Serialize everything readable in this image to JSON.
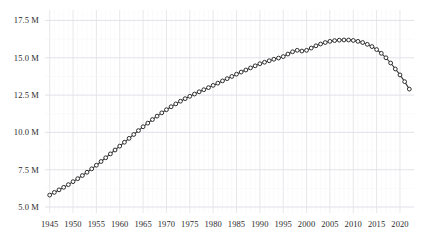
{
  "chart_data": {
    "type": "line",
    "title": "",
    "subtitle": "",
    "xlabel": "",
    "ylabel": "",
    "xlim": [
      1944,
      2023
    ],
    "ylim": [
      4600000,
      18200000
    ],
    "grid": true,
    "legend": false,
    "marker": "open-circle",
    "line_color": "#3a3a3a",
    "marker_face_color": "#ffffff",
    "marker_edge_color": "#2e2e2e",
    "grid_color": "#e8e8ec",
    "background_color": "#ffffff",
    "ytick_values": [
      5000000,
      7500000,
      10000000,
      12500000,
      15000000,
      17500000
    ],
    "ytick_labels": [
      "5.0 M",
      "7.5 M",
      "10.0 M",
      "12.5 M",
      "15.0 M",
      "17.5 M"
    ],
    "xtick_values": [
      1945,
      1950,
      1955,
      1960,
      1965,
      1970,
      1975,
      1980,
      1985,
      1990,
      1995,
      2000,
      2005,
      2010,
      2015,
      2020
    ],
    "xtick_labels": [
      "1945",
      "1950",
      "1955",
      "1960",
      "1965",
      "1970",
      "1975",
      "1980",
      "1985",
      "1990",
      "1995",
      "2000",
      "2005",
      "2010",
      "2015",
      "2020"
    ],
    "x": [
      1945,
      1946,
      1947,
      1948,
      1949,
      1950,
      1951,
      1952,
      1953,
      1954,
      1955,
      1956,
      1957,
      1958,
      1959,
      1960,
      1961,
      1962,
      1963,
      1964,
      1965,
      1966,
      1967,
      1968,
      1969,
      1970,
      1971,
      1972,
      1973,
      1974,
      1975,
      1976,
      1977,
      1978,
      1979,
      1980,
      1981,
      1982,
      1983,
      1984,
      1985,
      1986,
      1987,
      1988,
      1989,
      1990,
      1991,
      1992,
      1993,
      1994,
      1995,
      1996,
      1997,
      1998,
      1999,
      2000,
      2001,
      2002,
      2003,
      2004,
      2005,
      2006,
      2007,
      2008,
      2009,
      2010,
      2011,
      2012,
      2013,
      2014,
      2015,
      2016,
      2017,
      2018,
      2019,
      2020,
      2021,
      2022
    ],
    "values": [
      5800000,
      5980000,
      6150000,
      6320000,
      6500000,
      6700000,
      6900000,
      7110000,
      7330000,
      7560000,
      7800000,
      8050000,
      8300000,
      8560000,
      8820000,
      9080000,
      9340000,
      9600000,
      9860000,
      10120000,
      10380000,
      10620000,
      10860000,
      11090000,
      11310000,
      11520000,
      11720000,
      11910000,
      12090000,
      12260000,
      12420000,
      12570000,
      12720000,
      12860000,
      13000000,
      13150000,
      13300000,
      13450000,
      13600000,
      13750000,
      13900000,
      14040000,
      14180000,
      14320000,
      14460000,
      14600000,
      14700000,
      14800000,
      14900000,
      14980000,
      15080000,
      15250000,
      15400000,
      15500000,
      15450000,
      15500000,
      15650000,
      15800000,
      15920000,
      16020000,
      16100000,
      16150000,
      16180000,
      16190000,
      16190000,
      16160000,
      16100000,
      16020000,
      15900000,
      15750000,
      15550000,
      15300000,
      15000000,
      14650000,
      14250000,
      13850000,
      13400000,
      12900000
    ]
  }
}
